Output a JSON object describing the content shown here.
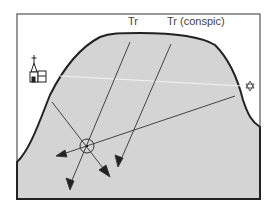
{
  "diagram": {
    "labels": {
      "tr": "Tr",
      "tr_conspic": "Tr (conspic)"
    },
    "icons": [
      "church-icon",
      "star-light-icon",
      "position-fix-icon"
    ],
    "colors": {
      "land": "#d4d4d4",
      "line": "#333333",
      "frame": "#555555",
      "background": "#ffffff"
    }
  }
}
